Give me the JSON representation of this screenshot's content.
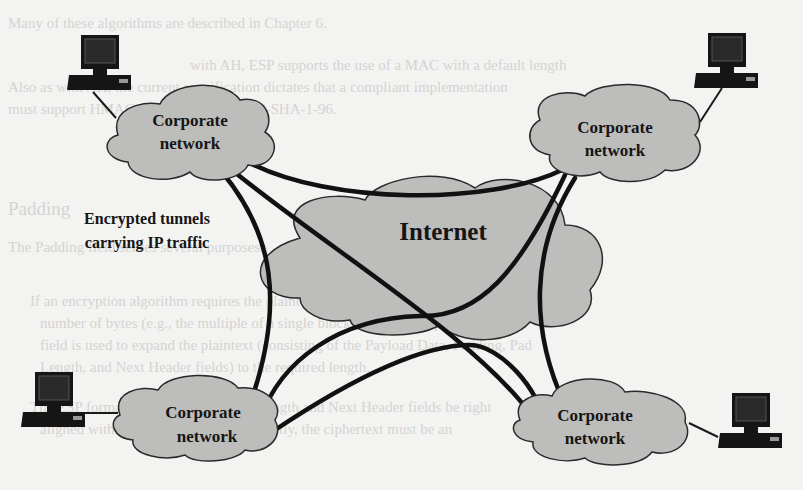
{
  "figure": {
    "center_cloud": {
      "label": "Internet"
    },
    "annotation": {
      "line1": "Encrypted tunnels",
      "line2": "carrying IP traffic"
    },
    "nodes": [
      {
        "id": "corp-top-left",
        "line1": "Corporate",
        "line2": "network"
      },
      {
        "id": "corp-top-right",
        "line1": "Corporate",
        "line2": "network"
      },
      {
        "id": "corp-bottom-left",
        "line1": "Corporate",
        "line2": "network"
      },
      {
        "id": "corp-bottom-right",
        "line1": "Corporate",
        "line2": "network"
      }
    ],
    "computers": [
      {
        "id": "pc-top-left",
        "icon": "desktop-computer-icon"
      },
      {
        "id": "pc-top-right",
        "icon": "desktop-computer-icon"
      },
      {
        "id": "pc-bottom-left",
        "icon": "desktop-computer-icon"
      },
      {
        "id": "pc-bottom-right",
        "icon": "desktop-computer-icon"
      }
    ],
    "colors": {
      "cloud_fill": "#bdbdbb",
      "cloud_stroke": "#2a2a2a",
      "tunnel": "#111111",
      "paper": "#f3f3f1",
      "bleed_text": "#d4d4d2"
    }
  },
  "bleed_through": {
    "lines": [
      "Many of these algorithms are described in Chapter 6.",
      "with AH, ESP supports the use of a MAC with a default length",
      "Also as with AH, the current specification dictates that a compliant implementation",
      "must support HMAC-MD5-96 and HMAC-SHA-1-96.",
      "Padding",
      "The Padding field serves several purposes:",
      "If an encryption algorithm requires the plaintext to be a multiple of some",
      "number of bytes (e.g., the multiple of a single block for a block cipher), the",
      "field is used to expand the plaintext (consisting of the Payload Data, Padding, Pad",
      "Length, and Next Header fields) to the required length.",
      "The ESP format requires that the Pad Length and Next Header fields be right",
      "aligned within a 32-bit word. Equivalently, the ciphertext must be an"
    ]
  }
}
